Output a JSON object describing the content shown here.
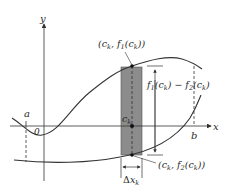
{
  "figure": {
    "type": "area-between-curves",
    "axes": {
      "x_label": "x",
      "y_label": "y",
      "origin_label": "0"
    },
    "bounds": {
      "a_label": "a",
      "b_label": "b"
    },
    "curves": [
      {
        "name": "f1",
        "role": "upper"
      },
      {
        "name": "f2",
        "role": "lower"
      }
    ],
    "labels": {
      "upper_point": "(c_k, f1(c_k))",
      "lower_point": "(c_k, f2(c_k))",
      "height": "f1(c_k) − f2(c_k)",
      "sample_point": "c_k",
      "width": "Δx_k"
    },
    "colors": {
      "rect_fill": "#8c8c8c",
      "curve": "#333333",
      "axis": "#333333"
    }
  }
}
